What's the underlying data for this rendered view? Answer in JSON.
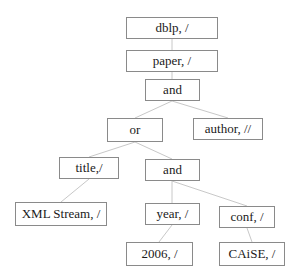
{
  "diagram": {
    "type": "query-tree",
    "edge_color": "#c8c8c8",
    "border_color": "#8a8a8a",
    "nodes": [
      {
        "id": "n_dblp",
        "label": "dblp, /",
        "x": 126,
        "y": 17,
        "w": 92,
        "h": 22
      },
      {
        "id": "n_paper",
        "label": "paper, /",
        "x": 126,
        "y": 50,
        "w": 92,
        "h": 22
      },
      {
        "id": "n_and1",
        "label": "and",
        "x": 145,
        "y": 79,
        "w": 55,
        "h": 22
      },
      {
        "id": "n_or",
        "label": "or",
        "x": 107,
        "y": 118,
        "w": 56,
        "h": 24
      },
      {
        "id": "n_author",
        "label": "author, //",
        "x": 193,
        "y": 118,
        "w": 70,
        "h": 22
      },
      {
        "id": "n_title",
        "label": "title,/",
        "x": 59,
        "y": 157,
        "w": 60,
        "h": 22
      },
      {
        "id": "n_and2",
        "label": "and",
        "x": 145,
        "y": 159,
        "w": 55,
        "h": 22
      },
      {
        "id": "n_xml",
        "label": "XML Stream, /",
        "x": 15,
        "y": 202,
        "w": 92,
        "h": 24
      },
      {
        "id": "n_year",
        "label": "year, /",
        "x": 145,
        "y": 203,
        "w": 55,
        "h": 22
      },
      {
        "id": "n_conf",
        "label": "conf, /",
        "x": 219,
        "y": 206,
        "w": 56,
        "h": 22
      },
      {
        "id": "n_2006",
        "label": "2006, /",
        "x": 126,
        "y": 242,
        "w": 67,
        "h": 24
      },
      {
        "id": "n_caise",
        "label": "CAiSE, /",
        "x": 219,
        "y": 242,
        "w": 66,
        "h": 24
      }
    ],
    "edges": [
      {
        "from": "n_dblp",
        "to": "n_paper",
        "x1": 172,
        "y1": 39,
        "x2": 172,
        "y2": 50
      },
      {
        "from": "n_paper",
        "to": "n_and1",
        "x1": 172,
        "y1": 72,
        "x2": 172,
        "y2": 79
      },
      {
        "from": "n_and1",
        "to": "n_or",
        "x1": 172,
        "y1": 101,
        "x2": 135,
        "y2": 118
      },
      {
        "from": "n_and1",
        "to": "n_author",
        "x1": 172,
        "y1": 101,
        "x2": 228,
        "y2": 118
      },
      {
        "from": "n_or",
        "to": "n_title",
        "x1": 135,
        "y1": 142,
        "x2": 89,
        "y2": 157
      },
      {
        "from": "n_or",
        "to": "n_and2",
        "x1": 135,
        "y1": 142,
        "x2": 172,
        "y2": 159
      },
      {
        "from": "n_title",
        "to": "n_xml",
        "x1": 89,
        "y1": 179,
        "x2": 61,
        "y2": 202
      },
      {
        "from": "n_and2",
        "to": "n_year",
        "x1": 172,
        "y1": 181,
        "x2": 172,
        "y2": 203
      },
      {
        "from": "n_and2",
        "to": "n_conf",
        "x1": 172,
        "y1": 181,
        "x2": 247,
        "y2": 206
      },
      {
        "from": "n_year",
        "to": "n_2006",
        "x1": 172,
        "y1": 225,
        "x2": 159,
        "y2": 242
      },
      {
        "from": "n_conf",
        "to": "n_caise",
        "x1": 247,
        "y1": 228,
        "x2": 252,
        "y2": 242
      }
    ]
  }
}
